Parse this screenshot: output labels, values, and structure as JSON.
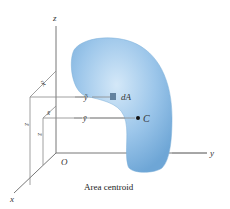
{
  "figure": {
    "caption": "Area centroid",
    "axes": {
      "z": "z",
      "y": "y",
      "x": "x",
      "origin": "O"
    },
    "labels": {
      "x_tilde": "x̃",
      "x_bar": "x̄",
      "y_tilde": "ỹ",
      "y_bar": "ȳ",
      "z_tilde": "z̃",
      "z_bar": "z̄",
      "element": "dA",
      "centroid": "C"
    },
    "colors": {
      "shape_fill": "#8fbde6",
      "shape_light": "#c9e1f5",
      "shape_dark": "#6aa2d4",
      "lines": "#777777"
    }
  }
}
